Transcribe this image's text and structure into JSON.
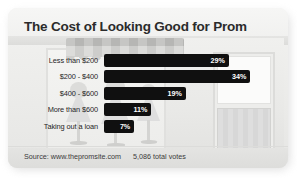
{
  "card": {
    "title": "The Cost of Looking Good for Prom",
    "footer": {
      "source": "Source: www.thepromsite.com",
      "total_votes": "5,086 total votes"
    }
  },
  "chart_data": {
    "type": "bar",
    "orientation": "horizontal",
    "title": "The Cost of Looking Good for Prom",
    "xlabel": "",
    "ylabel": "",
    "xlim": [
      0,
      40
    ],
    "grid": false,
    "legend": false,
    "value_suffix": "%",
    "categories": [
      "Less than $200",
      "$200 - $400",
      "$400 - $600",
      "More than $600",
      "Taking out a loan"
    ],
    "values": [
      29,
      34,
      19,
      11,
      7
    ],
    "labels": [
      "29%",
      "34%",
      "19%",
      "11%",
      "7%"
    ],
    "bars": [
      {
        "category": "Less than $200",
        "value": 29,
        "label": "29%"
      },
      {
        "category": "$200 - $400",
        "value": 34,
        "label": "34%"
      },
      {
        "category": "$400 - $600",
        "value": 19,
        "label": "19%"
      },
      {
        "category": "More than $600",
        "value": 11,
        "label": "11%"
      },
      {
        "category": "Taking out a loan",
        "value": 7,
        "label": "7%"
      }
    ],
    "bar_color": "#101010",
    "label_color": "#ffffff",
    "background_color": "#f2f2f0"
  },
  "illustration": {
    "scene": "storefront-with-awning-and-dress-forms"
  }
}
